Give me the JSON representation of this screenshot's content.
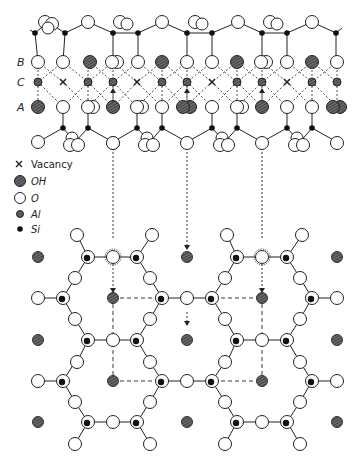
{
  "diagram": {
    "layer_labels": {
      "B": "B",
      "C": "C",
      "A": "A"
    },
    "legend": [
      {
        "symbol": "×",
        "label": "Vacancy",
        "italic": false
      },
      {
        "symbol": "hatched-circle",
        "label": "OH",
        "italic": true
      },
      {
        "symbol": "open-circle",
        "label": "O",
        "italic": true
      },
      {
        "symbol": "grey-dot",
        "label": "Al",
        "italic": true
      },
      {
        "symbol": "black-dot",
        "label": "Si",
        "italic": true
      }
    ],
    "colors": {
      "line": "#222222",
      "oh_fill": "#555555",
      "al_fill": "#444444",
      "si_fill": "#111111",
      "o_fill": "#ffffff"
    }
  }
}
